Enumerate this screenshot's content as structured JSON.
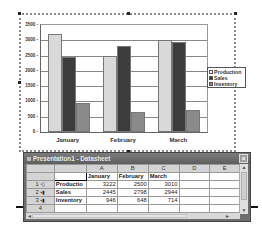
{
  "chart_data": {
    "type": "bar",
    "title": "",
    "xlabel": "",
    "ylabel": "",
    "categories": [
      "January",
      "February",
      "March"
    ],
    "series": [
      {
        "name": "Production",
        "values": [
          3222,
          2500,
          3010
        ],
        "color": "#d9d9d9"
      },
      {
        "name": "Sales",
        "values": [
          2445,
          2798,
          2944
        ],
        "color": "#3c3c3c"
      },
      {
        "name": "Inventory",
        "values": [
          946,
          648,
          714
        ],
        "color": "#8a8a8a"
      }
    ],
    "ylim": [
      0,
      3500
    ],
    "yticks": [
      "3500",
      "3000",
      "2500",
      "2000",
      "1500",
      "1000",
      "500",
      "0"
    ],
    "grid": true,
    "legend_position": "right"
  },
  "legend": {
    "items": [
      {
        "label": "Production"
      },
      {
        "label": "Sales"
      },
      {
        "label": "Inventory"
      }
    ]
  },
  "datasheet": {
    "title": "Presentation1 - Datasheet",
    "close_label": "×",
    "column_headers": [
      "",
      "",
      "A",
      "B",
      "C",
      "D",
      "E"
    ],
    "header_row": [
      "",
      "January",
      "February",
      "March",
      "",
      ""
    ],
    "rows": [
      {
        "num": "1",
        "label": "Productio",
        "values": [
          "3222",
          "2500",
          "3010"
        ]
      },
      {
        "num": "2",
        "label": "Sales",
        "values": [
          "2445",
          "2798",
          "2944"
        ]
      },
      {
        "num": "3",
        "label": "Inventory",
        "values": [
          "946",
          "648",
          "714"
        ]
      },
      {
        "num": "4",
        "label": "",
        "values": [
          "",
          "",
          ""
        ]
      }
    ],
    "scroll_up": "▲",
    "scroll_down": "▼",
    "scroll_left": "◄",
    "scroll_right": "►"
  }
}
